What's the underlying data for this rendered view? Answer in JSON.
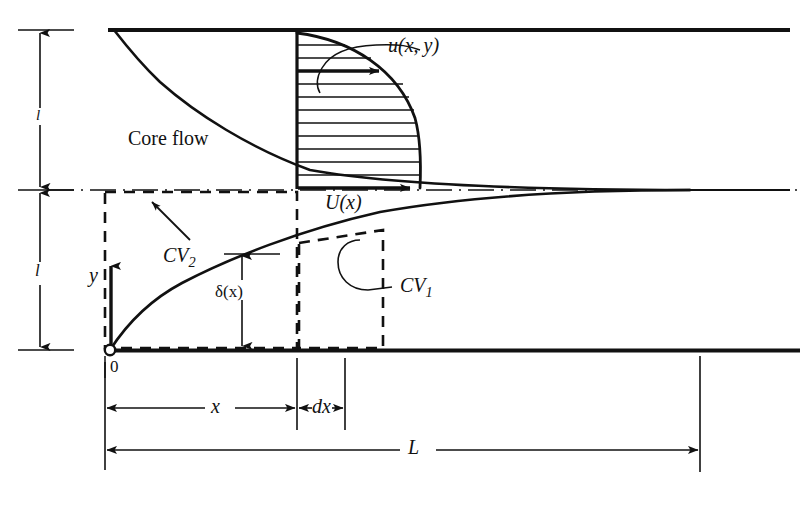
{
  "figure": {
    "background_color": "#ffffff",
    "ink_color": "#111111",
    "labels": {
      "core_flow": "Core flow",
      "velocity_profile": "u(x, y)",
      "core_velocity": "U(x)",
      "control_volume_2": "CV",
      "control_volume_2_sub": "2",
      "control_volume_1": "CV",
      "control_volume_1_sub": "1",
      "boundary_layer_thickness": "δ(x)",
      "y_axis": "y",
      "origin": "0",
      "half_height_upper": "l",
      "half_height_lower": "l",
      "distance_x": "x",
      "differential_dx": "dx",
      "entrance_length": "L"
    }
  },
  "geometry": {
    "top_wall": {
      "y": 30,
      "x_start": 108,
      "x_end": 790
    },
    "bottom_wall": {
      "y": 350,
      "x_start": 108,
      "x_end": 800
    },
    "centerline": {
      "y": 190,
      "x_start": 48,
      "x_end": 800
    },
    "origin_point": {
      "x": 110,
      "y": 350
    },
    "convergence_point": {
      "x": 690,
      "y": 190
    },
    "velocity_profile_box": {
      "x_left": 297,
      "x_right": 420,
      "y_top": 33,
      "y_bottom": 188
    },
    "profile_hatch_count": 11,
    "cv2_box": {
      "x_left": 105,
      "x_right": 297,
      "y_top": 192,
      "y_bottom": 348
    },
    "cv1_box": {
      "x_left": 299,
      "x_right": 383,
      "y_top": 243,
      "y_bottom": 348
    },
    "dimension_lines": {
      "x_tick_positions": [
        105,
        297,
        345
      ],
      "x_dimension_y": 408,
      "L_dimension_y": 450,
      "L_right_x": 700
    },
    "vertical_dimension_x": 40,
    "vertical_segments": [
      {
        "label": "l",
        "y_top": 30,
        "y_bottom": 190
      },
      {
        "label": "l",
        "y_top": 190,
        "y_bottom": 350
      }
    ]
  }
}
